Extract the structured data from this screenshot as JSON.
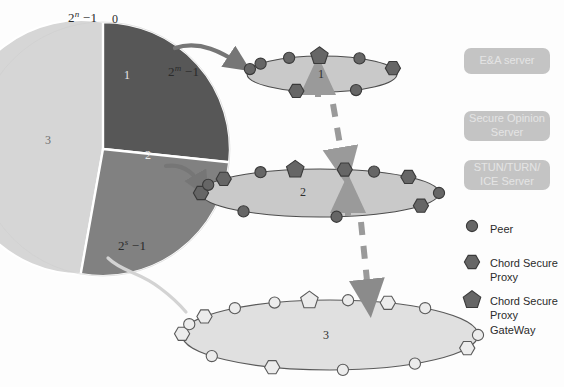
{
  "diagram": {
    "pie": {
      "label_top_left": "2",
      "label_top_left_sup": "n",
      "label_top_left_tail": " −1",
      "label_zero": "0",
      "label_slice1_end": "2",
      "label_slice1_end_sup": "m",
      "label_slice1_end_tail": " −1",
      "label_slice2_end": "2",
      "label_slice2_end_sup": "s",
      "label_slice2_end_tail": " −1",
      "slices": [
        {
          "id": "1",
          "name": "slice-1",
          "label": "1",
          "color": "#575757",
          "start_deg": 0,
          "end_deg": 84
        },
        {
          "id": "2",
          "name": "slice-2",
          "label": "2",
          "color": "#818181",
          "start_deg": 84,
          "end_deg": 190
        },
        {
          "id": "3",
          "name": "slice-3",
          "label": "3",
          "color": "#d6d6d6",
          "start_deg": 190,
          "end_deg": 360
        }
      ]
    },
    "rings": [
      {
        "id": "ring-1",
        "label": "1",
        "fill": "#c9c9c9",
        "stroke": "#4c4c4c",
        "node_color": "#666666",
        "node_stroke": "#3a3a3a",
        "nodes": [
          {
            "type": "circle",
            "name": "peer"
          },
          {
            "type": "circle",
            "name": "peer"
          },
          {
            "type": "circle",
            "name": "peer"
          },
          {
            "type": "pentagon",
            "name": "chord-secure-proxy-gateway"
          },
          {
            "type": "circle",
            "name": "peer"
          },
          {
            "type": "hexagon",
            "name": "chord-secure-proxy"
          },
          {
            "type": "circle",
            "name": "peer"
          },
          {
            "type": "hexagon",
            "name": "chord-secure-proxy"
          }
        ]
      },
      {
        "id": "ring-2",
        "label": "2",
        "fill": "#c9c9c9",
        "stroke": "#4c4c4c",
        "node_color": "#666666",
        "node_stroke": "#3a3a3a",
        "nodes": [
          {
            "type": "hexagon",
            "name": "chord-secure-proxy"
          },
          {
            "type": "circle",
            "name": "peer"
          },
          {
            "type": "hexagon",
            "name": "chord-secure-proxy"
          },
          {
            "type": "circle",
            "name": "peer"
          },
          {
            "type": "pentagon",
            "name": "chord-secure-proxy-gateway"
          },
          {
            "type": "hexagon",
            "name": "chord-secure-proxy"
          },
          {
            "type": "circle",
            "name": "peer"
          },
          {
            "type": "hexagon",
            "name": "chord-secure-proxy"
          },
          {
            "type": "circle",
            "name": "peer"
          },
          {
            "type": "hexagon",
            "name": "chord-secure-proxy"
          },
          {
            "type": "circle",
            "name": "peer"
          },
          {
            "type": "circle",
            "name": "peer"
          }
        ]
      },
      {
        "id": "ring-3",
        "label": "3",
        "fill": "#e0e0e0",
        "stroke": "#5a5a5a",
        "node_color": "#ececec",
        "node_stroke": "#5a5a5a",
        "nodes": [
          {
            "type": "hexagon",
            "name": "chord-secure-proxy"
          },
          {
            "type": "circle",
            "name": "peer"
          },
          {
            "type": "hexagon",
            "name": "chord-secure-proxy"
          },
          {
            "type": "circle",
            "name": "peer"
          },
          {
            "type": "circle",
            "name": "peer"
          },
          {
            "type": "pentagon",
            "name": "chord-secure-proxy-gateway"
          },
          {
            "type": "circle",
            "name": "peer"
          },
          {
            "type": "hexagon",
            "name": "chord-secure-proxy"
          },
          {
            "type": "circle",
            "name": "peer"
          },
          {
            "type": "circle",
            "name": "peer"
          },
          {
            "type": "hexagon",
            "name": "chord-secure-proxy"
          },
          {
            "type": "circle",
            "name": "peer"
          },
          {
            "type": "circle",
            "name": "peer"
          },
          {
            "type": "hexagon",
            "name": "chord-secure-proxy"
          },
          {
            "type": "circle",
            "name": "peer"
          }
        ]
      }
    ],
    "servers": [
      {
        "id": "ea-server",
        "label": "E&A server"
      },
      {
        "id": "secure-opinion-server",
        "label": "Secure Opinion\nServer"
      },
      {
        "id": "stun-turn-ice-server",
        "label": "STUN/TURN/\nICE Server"
      }
    ],
    "legend": [
      {
        "id": "legend-peer",
        "shape": "circle",
        "label": "Peer"
      },
      {
        "id": "legend-chord-secure-proxy",
        "shape": "hexagon",
        "label": "Chord Secure\nProxy"
      },
      {
        "id": "legend-chord-secure-proxy-gateway",
        "shape": "pentagon",
        "label": "Chord Secure\nProxy GateWay"
      }
    ],
    "colors": {
      "dark_slice": "#575757",
      "mid_slice": "#818181",
      "light_slice": "#d6d6d6",
      "arrow_solid": "#767676",
      "arrow_dashed": "#9a9a9a",
      "server_box": "#c4c4c4",
      "connector_light": "#d0d0d0"
    }
  }
}
